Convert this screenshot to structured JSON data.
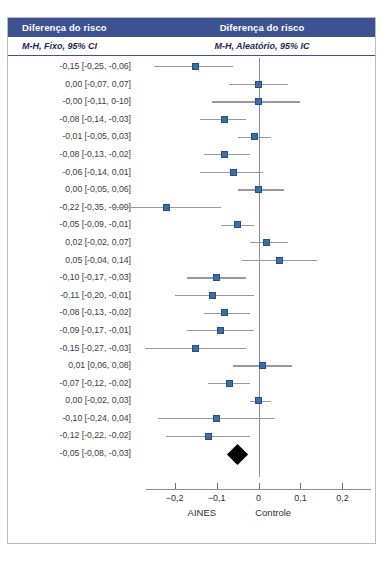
{
  "header": {
    "left_title": "Diferença do risco",
    "left_subtitle": "M-H, Fixo, 95% CI",
    "right_title": "Diferença do risco",
    "right_subtitle": "M-H, Aleatório, 95% IC",
    "band_color": "#3c5291"
  },
  "chart_data": {
    "type": "forest",
    "title": "Diferença do risco",
    "xlabel": "",
    "ylabel": "",
    "xlim": [
      -0.28,
      0.28
    ],
    "effect_measure": "Diferença do risco",
    "model_left": "M-H, Fixo, 95% CI",
    "model_right": "M-H, Aleatório, 95% IC",
    "null_line": 0,
    "grid": false,
    "xticks": [
      -0.2,
      -0.1,
      0,
      0.1,
      0.2
    ],
    "xtick_labels": [
      "−0,2",
      "−0,1",
      "0",
      "0,1",
      "0,2"
    ],
    "group_labels": [
      {
        "text": "AINES",
        "x": -0.135
      },
      {
        "text": "Controle",
        "x": 0.035
      }
    ],
    "marker_color": "#3a6ea8",
    "line_color": "#96999f",
    "diamond_color": "#000000",
    "rows": [
      {
        "label": "-0,15 [-0,25, -0,06]",
        "estimate": -0.15,
        "lower": -0.25,
        "upper": -0.06
      },
      {
        "label": "0,00 [-0,07, 0,07]",
        "estimate": 0.0,
        "lower": -0.07,
        "upper": 0.07
      },
      {
        "label": "-0,00 [-0,11, 0-10]",
        "estimate": -0.0,
        "lower": -0.11,
        "upper": 0.1
      },
      {
        "label": "-0,08 [-0,14, -0,03]",
        "estimate": -0.08,
        "lower": -0.14,
        "upper": -0.03
      },
      {
        "label": "-0,01 [-0,05, 0,03]",
        "estimate": -0.01,
        "lower": -0.05,
        "upper": 0.03
      },
      {
        "label": "-0,08 [-0,13, -0,02]",
        "estimate": -0.08,
        "lower": -0.13,
        "upper": -0.02
      },
      {
        "label": "-0,06 [-0,14, 0,01]",
        "estimate": -0.06,
        "lower": -0.14,
        "upper": 0.01
      },
      {
        "label": "0,00 [-0,05, 0,06]",
        "estimate": 0.0,
        "lower": -0.05,
        "upper": 0.06
      },
      {
        "label": "-0,22 [-0,35, -0,09]",
        "estimate": -0.22,
        "lower": -0.35,
        "upper": -0.09
      },
      {
        "label": "-0,05 [-0,09, -0,01]",
        "estimate": -0.05,
        "lower": -0.09,
        "upper": -0.01
      },
      {
        "label": "0,02 [-0,02, 0,07]",
        "estimate": 0.02,
        "lower": -0.02,
        "upper": 0.07
      },
      {
        "label": "0,05 [-0,04, 0,14]",
        "estimate": 0.05,
        "lower": -0.04,
        "upper": 0.14
      },
      {
        "label": "-0,10 [-0,17, -0,03]",
        "estimate": -0.1,
        "lower": -0.17,
        "upper": -0.03
      },
      {
        "label": "-0,11 [-0,20, -0,01]",
        "estimate": -0.11,
        "lower": -0.2,
        "upper": -0.01
      },
      {
        "label": "-0,08 [-0,13, -0,02]",
        "estimate": -0.08,
        "lower": -0.13,
        "upper": -0.02
      },
      {
        "label": "-0,09 [-0,17, -0,01]",
        "estimate": -0.09,
        "lower": -0.17,
        "upper": -0.01
      },
      {
        "label": "-0,15 [-0,27, -0,03]",
        "estimate": -0.15,
        "lower": -0.27,
        "upper": -0.03
      },
      {
        "label": "0,01 [0,06, 0,08]",
        "estimate": 0.01,
        "lower": -0.06,
        "upper": 0.08
      },
      {
        "label": "-0,07 [-0,12, -0,02]",
        "estimate": -0.07,
        "lower": -0.12,
        "upper": -0.02
      },
      {
        "label": "0,00 [-0,02, 0,03]",
        "estimate": 0.0,
        "lower": -0.02,
        "upper": 0.03
      },
      {
        "label": "-0,10 [-0,24, 0,04]",
        "estimate": -0.1,
        "lower": -0.24,
        "upper": 0.04
      },
      {
        "label": "-0,12 [-0,22, -0,02]",
        "estimate": -0.12,
        "lower": -0.22,
        "upper": -0.02
      }
    ],
    "summary": {
      "label": "-0,05 [-0,08, -0,03]",
      "estimate": -0.05,
      "lower": -0.08,
      "upper": -0.03
    }
  }
}
